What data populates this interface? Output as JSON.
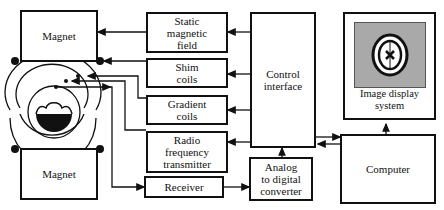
{
  "diagram": {
    "type": "MRI system block diagram",
    "blocks": {
      "magnet_top": "Magnet",
      "magnet_bottom": "Magnet",
      "static_field": "Static\nmagnetic\nfield",
      "shim_coils": "Shim\ncoils",
      "gradient_coils": "Gradient\ncoils",
      "rf_transmitter": "Radio\nfrequency\ntransmitter",
      "receiver": "Receiver",
      "control_interface": "Control\ninterface",
      "adc": "Analog\nto digital\nconverter",
      "image_display": "Image display\nsystem",
      "computer": "Computer"
    },
    "connections": [
      {
        "from": "control_interface",
        "to": "static_field"
      },
      {
        "from": "control_interface",
        "to": "shim_coils"
      },
      {
        "from": "control_interface",
        "to": "gradient_coils"
      },
      {
        "from": "control_interface",
        "to": "rf_transmitter"
      },
      {
        "from": "static_field",
        "to": "magnet_top"
      },
      {
        "from": "shim_coils",
        "to": "magnet_top"
      },
      {
        "from": "gradient_coils",
        "to": "coils"
      },
      {
        "from": "rf_transmitter",
        "to": "coils"
      },
      {
        "from": "coils",
        "to": "receiver"
      },
      {
        "from": "receiver",
        "to": "adc"
      },
      {
        "from": "adc",
        "to": "control_interface"
      },
      {
        "from": "control_interface",
        "to": "computer"
      },
      {
        "from": "computer",
        "to": "control_interface"
      },
      {
        "from": "computer",
        "to": "image_display"
      }
    ],
    "colors": {
      "line": "#111111",
      "screen": "#a9a9a9"
    }
  }
}
